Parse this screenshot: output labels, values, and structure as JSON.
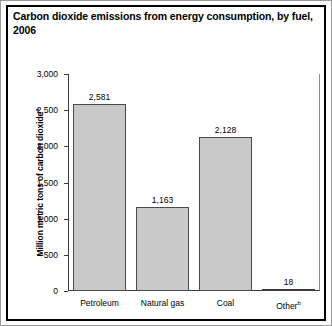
{
  "chart_data": {
    "type": "bar",
    "title": "Carbon dioxide emissions from energy consumption, by fuel, 2006",
    "title_line1": "Carbon dioxide emissions from energy consumption, by fuel,",
    "title_line2": "2006",
    "xlabel": "",
    "ylabel": "Million metric tons of carbon dioxide",
    "ylabel_superscript": "a",
    "categories": [
      "Petroleum",
      "Natural gas",
      "Coal",
      "Other"
    ],
    "category_superscripts": [
      "",
      "",
      "",
      "b"
    ],
    "values": [
      2581,
      1163,
      2128,
      18
    ],
    "value_labels": [
      "2,581",
      "1,163",
      "2,128",
      "18"
    ],
    "ylim": [
      0,
      3000
    ],
    "yticks": [
      3000,
      2500,
      2000,
      1500,
      1000,
      500,
      0
    ],
    "ytick_labels": [
      "3,000",
      "2,500",
      "2,000",
      "1,500",
      "1,000",
      "500",
      "0"
    ],
    "grid": false,
    "legend": null,
    "bar_color": "#c9c9c9",
    "bar_edge_color": "#4a4a4a",
    "frame_color": "#000000",
    "background": "#ffffff"
  }
}
